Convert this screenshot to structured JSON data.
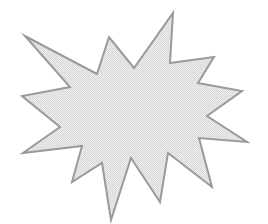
{
  "canvas": {
    "width": 268,
    "height": 224,
    "background": "#ffffff"
  },
  "shape": {
    "type": "explosion-starburst",
    "icon": "starburst-shape",
    "fill": "#e4e4e4",
    "stroke": "#9a9a9a",
    "stroke_width": 2,
    "points": "173,13 170,63 214,57 198,83 242,91 207,116 247,142 199,138 212,187 168,153 160,202 131,158 111,220 102,163 72,182 82,146 23,153 60,127 22,96 70,87 25,36 97,74 109,37 134,68"
  }
}
